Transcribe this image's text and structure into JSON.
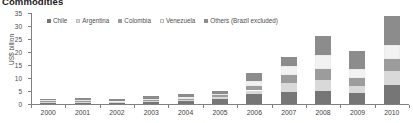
{
  "title": "Commodities",
  "yaxis": {
    "label": "US$ billion",
    "ticks": [
      "0",
      "5",
      "10",
      "15",
      "20",
      "25",
      "30",
      "35"
    ],
    "min": 0,
    "max": 35
  },
  "legend": [
    {
      "label": "Chile",
      "color": "#767676"
    },
    {
      "label": "Argentina",
      "color": "#d9d9d9"
    },
    {
      "label": "Colombia",
      "color": "#9c9c9c"
    },
    {
      "label": "Venezuela",
      "color": "#f2f2f2"
    },
    {
      "label": "Others (Brazil excluded)",
      "color": "#8c8c8c"
    }
  ],
  "chart_data": {
    "type": "bar",
    "subtype": "stacked-vertical",
    "title": "Commodities",
    "xlabel": "",
    "ylabel": "US$ billion",
    "ylim": [
      0,
      35
    ],
    "yticks": [
      0,
      5,
      10,
      15,
      20,
      25,
      30,
      35
    ],
    "grid": false,
    "legend_position": "top-left",
    "categories": [
      "2000",
      "2001",
      "2002",
      "2003",
      "2004",
      "2005",
      "2006",
      "2007",
      "2008",
      "2009",
      "2010"
    ],
    "series": [
      {
        "name": "Chile",
        "color": "#767676",
        "values": [
          0.4,
          0.5,
          0.4,
          0.6,
          1.0,
          2.1,
          4.0,
          4.6,
          5.1,
          4.4,
          7.2
        ]
      },
      {
        "name": "Argentina",
        "color": "#d9d9d9",
        "values": [
          0.4,
          0.4,
          0.3,
          0.4,
          0.5,
          0.6,
          1.2,
          3.6,
          4.2,
          2.7,
          5.6
        ]
      },
      {
        "name": "Colombia",
        "color": "#9c9c9c",
        "values": [
          0.3,
          0.4,
          0.3,
          0.5,
          0.6,
          0.7,
          1.6,
          3.1,
          4.1,
          2.9,
          4.6
        ]
      },
      {
        "name": "Venezuela",
        "color": "#f2f2f2",
        "values": [
          0.3,
          0.4,
          0.3,
          0.4,
          0.5,
          0.5,
          1.9,
          3.2,
          5.5,
          3.3,
          5.3
        ]
      },
      {
        "name": "Others (Brazil excluded)",
        "color": "#8c8c8c",
        "values": [
          0.6,
          0.8,
          0.6,
          1.1,
          1.4,
          1.1,
          3.3,
          3.5,
          7.1,
          7.2,
          11.3
        ]
      }
    ],
    "totals": [
      2.0,
      2.5,
      1.9,
      3.0,
      4.0,
      5.0,
      12.0,
      18.0,
      26.0,
      20.5,
      34.0
    ]
  }
}
